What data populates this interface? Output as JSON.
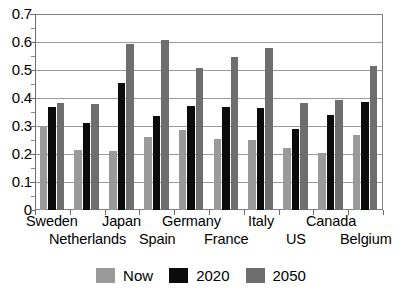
{
  "chart_data": {
    "type": "bar",
    "title": "",
    "subtitle": "",
    "xlabel": "",
    "ylabel": "",
    "ylim": [
      0,
      0.7
    ],
    "y_ticks": [
      "0",
      "0.1",
      "0.2",
      "0.3",
      "0.4",
      "0.5",
      "0.6",
      "0.7"
    ],
    "y_tick_values": [
      0,
      0.1,
      0.2,
      0.3,
      0.4,
      0.5,
      0.6,
      0.7
    ],
    "grid": "horizontal",
    "legend_position": "bottom-center",
    "categories": [
      "Sweden",
      "Netherlands",
      "Japan",
      "Spain",
      "Germany",
      "France",
      "Italy",
      "US",
      "Canada",
      "Belgium"
    ],
    "series": [
      {
        "name": "Now",
        "color": "#9a9a9a",
        "values": [
          0.3,
          0.215,
          0.21,
          0.26,
          0.285,
          0.255,
          0.25,
          0.22,
          0.203,
          0.267
        ]
      },
      {
        "name": "2020",
        "color": "#0b0b0b",
        "values": [
          0.368,
          0.31,
          0.452,
          0.334,
          0.37,
          0.368,
          0.366,
          0.291,
          0.34,
          0.387
        ]
      },
      {
        "name": "2050",
        "color": "#6e6e6e",
        "values": [
          0.382,
          0.377,
          0.592,
          0.606,
          0.507,
          0.548,
          0.579,
          0.381,
          0.394,
          0.514
        ]
      }
    ]
  },
  "legend": {
    "items": [
      {
        "label": "Now"
      },
      {
        "label": "2020"
      },
      {
        "label": "2050"
      }
    ]
  },
  "axis": {
    "y_labels": [
      "0.7",
      "0.6",
      "0.5",
      "0.4",
      "0.3",
      "0.2",
      "0.1",
      "0"
    ]
  }
}
